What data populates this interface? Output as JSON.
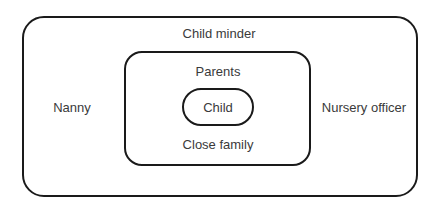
{
  "diagram": {
    "type": "nested-boxes",
    "layers": [
      {
        "id": "outer",
        "labels": {
          "top": "Child minder",
          "left": "Nanny",
          "right": "Nursery officer"
        }
      },
      {
        "id": "middle",
        "labels": {
          "top": "Parents",
          "bottom": "Close family"
        }
      },
      {
        "id": "inner",
        "labels": {
          "center": "Child"
        }
      }
    ],
    "colors": {
      "stroke": "#1a1a1a",
      "text": "#3a3a3a",
      "background": "#ffffff"
    }
  },
  "labels": {
    "child_minder": "Child minder",
    "nanny": "Nanny",
    "nursery_officer": "Nursery officer",
    "parents": "Parents",
    "close_family": "Close family",
    "child": "Child"
  }
}
